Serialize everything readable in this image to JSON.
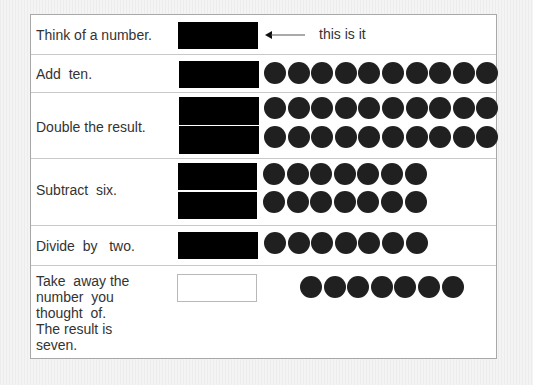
{
  "steps": [
    {
      "label": "Think of a number.",
      "note": "this is it",
      "boxes": 1,
      "dots_per_row": 0
    },
    {
      "label": "Add  ten.",
      "boxes": 1,
      "dots_per_row": 10
    },
    {
      "label": "Double the result.",
      "boxes": 2,
      "dots_per_row": 10
    },
    {
      "label": "Subtract  six.",
      "boxes": 2,
      "dots_per_row": 7
    },
    {
      "label": "Divide  by   two.",
      "boxes": 1,
      "dots_per_row": 7
    },
    {
      "label": "Take  away the\nnumber  you\nthought  of.\nThe result is\nseven.",
      "boxes": 0,
      "empty_box": true,
      "dots_per_row": 7
    }
  ],
  "colors": {
    "box": "#000000",
    "dot": "#202020",
    "border": "#c8c8c8"
  }
}
